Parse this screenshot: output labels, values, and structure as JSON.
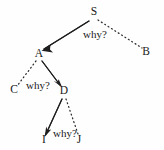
{
  "diagram": {
    "type": "derivation-tree",
    "background_color": "#fefefe",
    "ink_color": "#1f1f1f",
    "nodes": [
      {
        "id": "S",
        "label": "S",
        "x": 94,
        "y": 15
      },
      {
        "id": "A",
        "label": "A",
        "x": 39,
        "y": 57
      },
      {
        "id": "B",
        "label": "B",
        "x": 146,
        "y": 55
      },
      {
        "id": "C",
        "label": "C",
        "x": 14,
        "y": 93
      },
      {
        "id": "D",
        "label": "D",
        "x": 64,
        "y": 94
      },
      {
        "id": "I",
        "label": "I",
        "x": 44,
        "y": 143
      },
      {
        "id": "J",
        "label": "J",
        "x": 79,
        "y": 143
      }
    ],
    "edges": [
      {
        "id": "s-a",
        "from": "S",
        "to": "A",
        "style": "solid",
        "arrow": true,
        "x1": 89,
        "y1": 21,
        "x2": 44,
        "y2": 49
      },
      {
        "id": "s-b",
        "from": "S",
        "to": "B",
        "style": "dotted",
        "arrow": false,
        "x1": 98,
        "y1": 20,
        "x2": 142,
        "y2": 48
      },
      {
        "id": "a-c",
        "from": "A",
        "to": "C",
        "style": "dotted",
        "arrow": false,
        "x1": 36,
        "y1": 61,
        "x2": 17,
        "y2": 86
      },
      {
        "id": "a-d",
        "from": "A",
        "to": "D",
        "style": "solid",
        "arrow": true,
        "x1": 42,
        "y1": 61,
        "x2": 61,
        "y2": 86
      },
      {
        "id": "d-i",
        "from": "D",
        "to": "I",
        "style": "solid",
        "arrow": true,
        "x1": 62,
        "y1": 99,
        "x2": 46,
        "y2": 135
      },
      {
        "id": "d-j",
        "from": "D",
        "to": "J",
        "style": "dotted",
        "arrow": false,
        "x1": 66,
        "y1": 99,
        "x2": 78,
        "y2": 134
      }
    ],
    "edge_labels": [
      {
        "id": "why-1",
        "text": "why?",
        "x": 95,
        "y": 38
      },
      {
        "id": "why-2",
        "text": "why?",
        "x": 38,
        "y": 89
      },
      {
        "id": "why-3",
        "text": "why?",
        "x": 65,
        "y": 137
      }
    ]
  }
}
